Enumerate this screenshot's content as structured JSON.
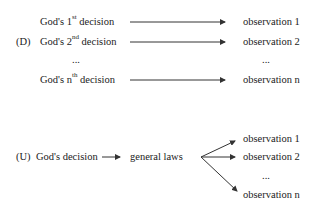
{
  "diagram": {
    "d_model": {
      "label": "(D)",
      "decisions": [
        {
          "prefix": "God's 1",
          "sup": "st",
          "suffix": " decision"
        },
        {
          "prefix": "God's 2",
          "sup": "nd",
          "suffix": " decision"
        },
        {
          "ellipsis": "..."
        },
        {
          "prefix": "God's n",
          "sup": "th",
          "suffix": " decision"
        }
      ],
      "observations": [
        "observation 1",
        "observation 2",
        "...",
        "observation n"
      ]
    },
    "u_model": {
      "label": "(U)",
      "decision": "God's decision",
      "middle": "general laws",
      "observations": [
        "observation 1",
        "observation 2",
        "...",
        "observation n"
      ]
    }
  }
}
